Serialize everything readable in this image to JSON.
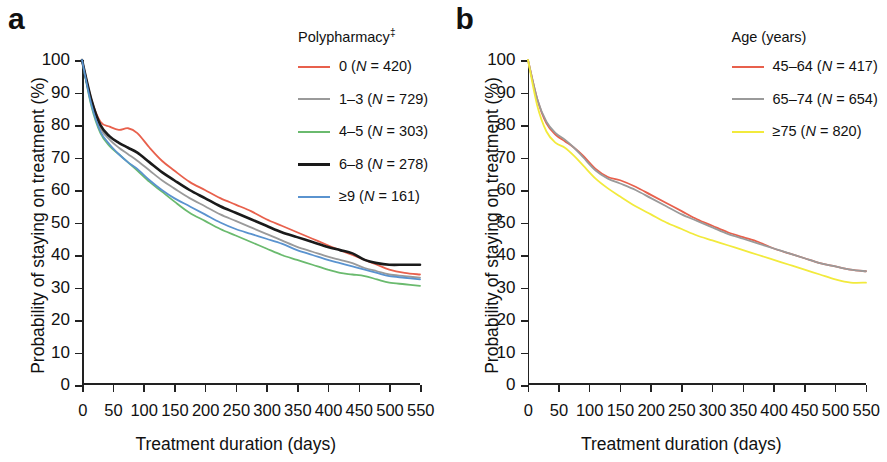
{
  "figure": {
    "panels": [
      {
        "label": "a",
        "axis": {
          "xlabel": "Treatment duration (days)",
          "ylabel": "Probability of staying on treatment (%)",
          "xticks": [
            "0",
            "50",
            "100",
            "150",
            "200",
            "250",
            "300",
            "350",
            "400",
            "450",
            "500",
            "550"
          ],
          "yticks": [
            "100",
            "90",
            "80",
            "70",
            "60",
            "50",
            "40",
            "30",
            "20",
            "10",
            "0"
          ]
        },
        "legend": {
          "title": "Polypharmacy",
          "title_superscript": "‡",
          "items": [
            {
              "label": "0 (",
              "n_prefix": "N",
              "n_value": " = 420)",
              "color": "#e8604c"
            },
            {
              "label": "1–3 (",
              "n_prefix": "N",
              "n_value": " = 729)",
              "color": "#9a9a9a"
            },
            {
              "label": "4–5 (",
              "n_prefix": "N",
              "n_value": " = 303)",
              "color": "#6aba6e"
            },
            {
              "label": "6–8 (",
              "n_prefix": "N",
              "n_value": " = 278)",
              "color": "#1a1a1a"
            },
            {
              "label": "≥9 (",
              "n_prefix": "N",
              "n_value": " = 161)",
              "color": "#5a93cf"
            }
          ]
        }
      },
      {
        "label": "b",
        "axis": {
          "xlabel": "Treatment duration (days)",
          "ylabel": "Probability of staying on treatment (%)",
          "xticks": [
            "0",
            "50",
            "100",
            "150",
            "200",
            "250",
            "300",
            "350",
            "400",
            "450",
            "500",
            "550"
          ],
          "yticks": [
            "100",
            "90",
            "80",
            "70",
            "60",
            "50",
            "40",
            "30",
            "20",
            "10",
            "0"
          ]
        },
        "legend": {
          "title": "Age (years)",
          "title_superscript": "",
          "items": [
            {
              "label": "45–64 (",
              "n_prefix": "N",
              "n_value": " = 417)",
              "color": "#e8604c"
            },
            {
              "label": "65–74 (",
              "n_prefix": "N",
              "n_value": " = 654)",
              "color": "#9a9a9a"
            },
            {
              "label": "≥75 (",
              "n_prefix": "N",
              "n_value": " = 820)",
              "color": "#f2ea3c"
            }
          ]
        }
      }
    ]
  },
  "chart_data": [
    {
      "type": "line",
      "panel": "a",
      "title": "Polypharmacy‡",
      "xlabel": "Treatment duration (days)",
      "ylabel": "Probability of staying on treatment (%)",
      "xlim": [
        0,
        550
      ],
      "ylim": [
        0,
        100
      ],
      "xticks": [
        0,
        50,
        100,
        150,
        200,
        250,
        300,
        350,
        400,
        450,
        500,
        550
      ],
      "yticks": [
        0,
        10,
        20,
        30,
        40,
        50,
        60,
        70,
        80,
        90,
        100
      ],
      "grid": false,
      "legend_position": "top-right-outside",
      "x": [
        0,
        15,
        30,
        45,
        60,
        75,
        90,
        110,
        130,
        150,
        175,
        200,
        225,
        250,
        275,
        300,
        325,
        350,
        375,
        400,
        420,
        440,
        460,
        480,
        500,
        525,
        550
      ],
      "series": [
        {
          "name": "0 (N = 420)",
          "n": 420,
          "color": "#e8604c",
          "values": [
            100,
            88,
            81,
            79.5,
            78.5,
            79,
            77.5,
            73,
            69,
            66,
            62.5,
            60,
            57.5,
            55.5,
            53.5,
            51,
            49,
            47,
            45,
            43,
            41.5,
            40,
            38.5,
            37,
            35.5,
            34.5,
            34
          ]
        },
        {
          "name": "1–3 (N = 729)",
          "n": 729,
          "color": "#9a9a9a",
          "values": [
            100,
            87,
            79,
            75.5,
            73,
            71,
            69,
            66,
            63,
            60.5,
            57.5,
            55,
            52.5,
            50.5,
            48.5,
            46.5,
            44.5,
            42.5,
            41,
            39.5,
            38.5,
            37.5,
            36,
            35,
            34,
            33.5,
            33
          ]
        },
        {
          "name": "4–5 (N = 303)",
          "n": 303,
          "color": "#6aba6e",
          "values": [
            100,
            86,
            77.5,
            73.5,
            71,
            68.5,
            66,
            62.5,
            59.5,
            56.5,
            53,
            50.5,
            48,
            46,
            44,
            42,
            40,
            38.5,
            37,
            35.5,
            34.5,
            34,
            33.5,
            32.5,
            31.5,
            31,
            30.5
          ]
        },
        {
          "name": "6–8 (N = 278)",
          "n": 278,
          "color": "#1a1a1a",
          "values": [
            100,
            88,
            80,
            76.5,
            74.5,
            73,
            71.5,
            68.5,
            65.5,
            63,
            60,
            57.5,
            55,
            53,
            51,
            49,
            47,
            45.5,
            44,
            42.5,
            41.5,
            40.5,
            38.5,
            37.5,
            37,
            37,
            37
          ]
        },
        {
          "name": "≥9 (N = 161)",
          "n": 161,
          "color": "#5a93cf",
          "values": [
            100,
            86.5,
            78,
            74,
            71,
            68.5,
            66.5,
            63,
            60,
            57.5,
            55,
            52.5,
            50,
            48,
            46.5,
            45,
            43.5,
            41.5,
            40,
            38.5,
            37.5,
            36.5,
            35.5,
            34.5,
            33.5,
            33,
            32.5
          ]
        }
      ]
    },
    {
      "type": "line",
      "panel": "b",
      "title": "Age (years)",
      "xlabel": "Treatment duration (days)",
      "ylabel": "Probability of staying on treatment (%)",
      "xlim": [
        0,
        550
      ],
      "ylim": [
        0,
        100
      ],
      "xticks": [
        0,
        50,
        100,
        150,
        200,
        250,
        300,
        350,
        400,
        450,
        500,
        550
      ],
      "yticks": [
        0,
        10,
        20,
        30,
        40,
        50,
        60,
        70,
        80,
        90,
        100
      ],
      "grid": false,
      "legend_position": "top-right-outside",
      "x": [
        0,
        15,
        30,
        45,
        60,
        75,
        90,
        110,
        130,
        150,
        175,
        200,
        225,
        250,
        275,
        300,
        325,
        350,
        375,
        400,
        425,
        450,
        475,
        500,
        525,
        550
      ],
      "series": [
        {
          "name": "45–64 (N = 417)",
          "n": 417,
          "color": "#e8604c",
          "values": [
            100,
            88,
            80.5,
            77,
            75,
            73,
            70.5,
            66.5,
            64,
            63,
            61,
            58.5,
            56,
            53.5,
            51,
            49,
            47,
            45.5,
            44,
            42,
            40.5,
            39,
            37.5,
            36.5,
            35.5,
            35
          ]
        },
        {
          "name": "65–74 (N = 654)",
          "n": 654,
          "color": "#9a9a9a",
          "values": [
            100,
            88,
            81,
            77.5,
            75.5,
            73,
            70,
            66,
            63.5,
            62,
            60,
            57.5,
            55,
            52.5,
            50.5,
            48.5,
            46.5,
            45,
            43.5,
            42,
            40.5,
            39,
            37.5,
            36.5,
            35.5,
            35
          ]
        },
        {
          "name": "≥75 (N = 820)",
          "n": 820,
          "color": "#f2ea3c",
          "values": [
            100,
            86,
            78,
            74.5,
            73,
            70.5,
            67.5,
            63.5,
            60.5,
            58,
            55,
            52.5,
            50,
            48,
            46,
            44.5,
            43,
            41.5,
            40,
            38.5,
            37,
            35.5,
            34,
            32.5,
            31.5,
            31.5
          ]
        }
      ]
    }
  ]
}
